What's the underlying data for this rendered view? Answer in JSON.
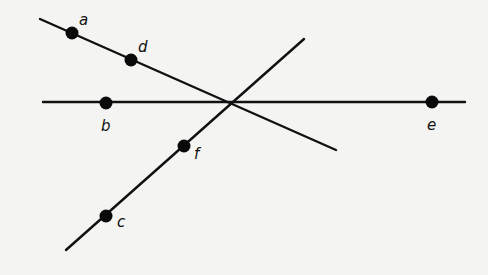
{
  "diagram": {
    "title": "",
    "lines": [
      {
        "id": "line-ad",
        "x1": 40,
        "y1": 19,
        "x2": 336,
        "y2": 150
      },
      {
        "id": "line-cf",
        "x1": 66,
        "y1": 250,
        "x2": 304,
        "y2": 39
      },
      {
        "id": "line-be",
        "x1": 43,
        "y1": 102,
        "x2": 465,
        "y2": 102
      }
    ],
    "intersection": {
      "x": 232,
      "y": 102
    },
    "points": [
      {
        "label": "a",
        "x": 72,
        "y": 33,
        "lx": 79,
        "ly": 25
      },
      {
        "label": "d",
        "x": 131,
        "y": 60,
        "lx": 138,
        "ly": 52
      },
      {
        "label": "b",
        "x": 106,
        "y": 103,
        "lx": 101,
        "ly": 131
      },
      {
        "label": "e",
        "x": 432,
        "y": 102,
        "lx": 427,
        "ly": 130
      },
      {
        "label": "f",
        "x": 184,
        "y": 146,
        "lx": 194,
        "ly": 159
      },
      {
        "label": "c",
        "x": 106,
        "y": 216,
        "lx": 117,
        "ly": 227
      }
    ],
    "colors": {
      "background": "#f4f4f2",
      "ink": "#111111"
    }
  }
}
